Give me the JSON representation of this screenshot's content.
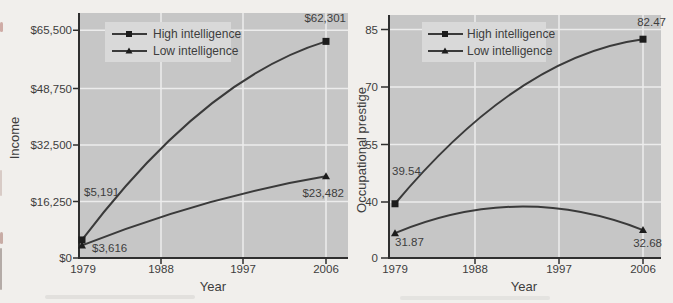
{
  "colors": {
    "page_bg": "#f1efec",
    "plot_bg": "#c6c6c6",
    "gridline": "#ececec",
    "axis": "#2f2f2f",
    "line": "#3a3a3a",
    "marker": "#1c1c1c",
    "text": "#3d3d3d",
    "legend_bg": "#d9d9d9"
  },
  "chart_data": [
    {
      "type": "line",
      "title": "",
      "xlabel": "Year",
      "ylabel": "Income",
      "x": [
        1979,
        2006
      ],
      "xticks": [
        "1979",
        "1988",
        "1997",
        "2006"
      ],
      "yticks": [
        "$0",
        "$16,250",
        "$32,500",
        "$48,750",
        "$65,500"
      ],
      "ytick_values": [
        0,
        16250,
        32500,
        48750,
        65500
      ],
      "ylim": [
        0,
        70800
      ],
      "grid": true,
      "legend_position": "upper-left",
      "series": [
        {
          "name": "High intelligence",
          "marker": "square",
          "values": [
            5191,
            62301
          ],
          "point_labels": [
            "$5,191",
            "$62,301"
          ]
        },
        {
          "name": "Low intelligence",
          "marker": "triangle",
          "values": [
            3616,
            23482
          ],
          "point_labels": [
            "$3,616",
            "$23,482"
          ]
        }
      ]
    },
    {
      "type": "line",
      "title": "",
      "xlabel": "Year",
      "ylabel": "Occupational prestige",
      "x": [
        1979,
        2006
      ],
      "xticks": [
        "1979",
        "1988",
        "1997",
        "2006"
      ],
      "yticks": [
        "0",
        "40",
        "55",
        "70",
        "85"
      ],
      "ytick_values": [
        0,
        40,
        55,
        70,
        85
      ],
      "ylim": [
        0,
        88
      ],
      "axis_break_below": 40,
      "grid": true,
      "legend_position": "upper-left",
      "series": [
        {
          "name": "High intelligence",
          "marker": "square",
          "values": [
            39.54,
            82.47
          ],
          "point_labels": [
            "39.54",
            "82.47"
          ]
        },
        {
          "name": "Low intelligence",
          "marker": "triangle",
          "values": [
            31.87,
            32.68
          ],
          "point_labels": [
            "31.87",
            "32.68"
          ]
        }
      ]
    }
  ]
}
